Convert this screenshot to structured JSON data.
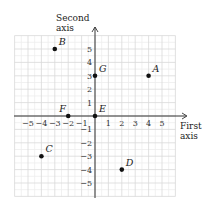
{
  "axes": {
    "x_label_line1": "First",
    "x_label_line2": "axis",
    "y_label_line1": "Second",
    "y_label_line2": "axis",
    "x_ticks": [
      "−5",
      "−4",
      "−3",
      "−2",
      "−1",
      "1",
      "2",
      "3",
      "4",
      "5"
    ],
    "y_ticks": [
      "5",
      "4",
      "3",
      "2",
      "1",
      "−1",
      "−2",
      "−3",
      "−4",
      "−5"
    ],
    "range": [
      -6,
      6
    ]
  },
  "points": [
    {
      "name": "A",
      "x": 4,
      "y": 3
    },
    {
      "name": "B",
      "x": -3,
      "y": 5
    },
    {
      "name": "C",
      "x": -4,
      "y": -3
    },
    {
      "name": "D",
      "x": 2,
      "y": -4
    },
    {
      "name": "E",
      "x": 0,
      "y": 0
    },
    {
      "name": "F",
      "x": -2,
      "y": 0
    },
    {
      "name": "G",
      "x": 0,
      "y": 3
    }
  ],
  "colors": {
    "grid_major": "#d9d9d9",
    "grid_minor": "#eeeeee",
    "axis": "#333333",
    "point": "#111111"
  }
}
